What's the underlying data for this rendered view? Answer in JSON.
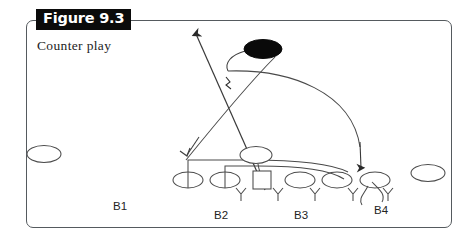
{
  "figure": {
    "tag": "Figure 9.3",
    "caption": "Counter play",
    "frame_color": "#555a5e",
    "tag_bg": "#0b0b0b",
    "tag_fg": "#ffffff"
  },
  "diagram": {
    "type": "football-play-diagram",
    "title": "Counter play",
    "ink_color": "#3a3a3a",
    "fill_color": "#0a0a0a",
    "position_labels": [
      {
        "id": "B1",
        "text": "B1",
        "x": 113,
        "y": 200
      },
      {
        "id": "B2",
        "text": "B2",
        "x": 214,
        "y": 209
      },
      {
        "id": "B3",
        "text": "B3",
        "x": 294,
        "y": 209
      },
      {
        "id": "B4",
        "text": "B4",
        "x": 374,
        "y": 204
      }
    ],
    "players": [
      {
        "id": "split-end-left",
        "shape": "ellipse-open",
        "cx": 44,
        "cy": 154,
        "rx": 17,
        "ry": 8.5
      },
      {
        "id": "lineman-1",
        "shape": "ellipse-slashed",
        "cx": 188,
        "cy": 180,
        "rx": 15,
        "ry": 8
      },
      {
        "id": "lineman-2",
        "shape": "ellipse-slashed",
        "cx": 225,
        "cy": 180,
        "rx": 15,
        "ry": 8
      },
      {
        "id": "center",
        "shape": "square",
        "cx": 262,
        "cy": 180,
        "size": 18
      },
      {
        "id": "lineman-3",
        "shape": "ellipse-open",
        "cx": 300,
        "cy": 180,
        "rx": 15,
        "ry": 8
      },
      {
        "id": "lineman-4",
        "shape": "ellipse-open",
        "cx": 337,
        "cy": 180,
        "rx": 15,
        "ry": 8
      },
      {
        "id": "tight-end",
        "shape": "ellipse-open",
        "cx": 375,
        "cy": 180,
        "rx": 15,
        "ry": 8
      },
      {
        "id": "quarterback",
        "shape": "ellipse-open",
        "cx": 256,
        "cy": 155,
        "rx": 16,
        "ry": 8.5
      },
      {
        "id": "receiver-right",
        "shape": "ellipse-open",
        "cx": 428,
        "cy": 173,
        "rx": 17,
        "ry": 8.5
      },
      {
        "id": "ball-carrier",
        "shape": "ellipse-filled",
        "cx": 263,
        "cy": 49,
        "rx": 19,
        "ry": 9.5
      }
    ],
    "defenders": [
      {
        "id": "defender-1",
        "x": 240,
        "y": 188
      },
      {
        "id": "defender-2",
        "x": 278,
        "y": 188
      },
      {
        "id": "defender-3",
        "x": 315,
        "y": 188
      },
      {
        "id": "defender-4",
        "x": 353,
        "y": 188
      },
      {
        "id": "defender-5",
        "x": 388,
        "y": 188
      }
    ],
    "routes": [
      {
        "id": "ball-carrier-path",
        "kind": "arrow",
        "desc": "ball carrier up-left"
      },
      {
        "id": "motion-path",
        "kind": "arrow",
        "desc": "sweep right to tight end"
      },
      {
        "id": "block-assignments",
        "kind": "pull-block",
        "desc": "linemen pull right"
      }
    ]
  }
}
